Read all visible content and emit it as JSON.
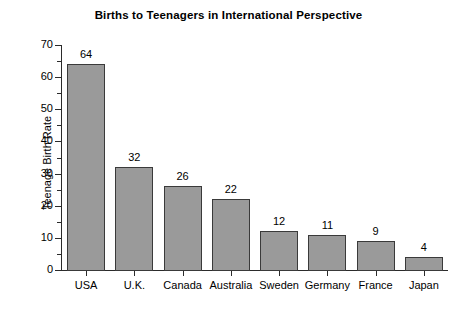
{
  "chart_data": {
    "type": "bar",
    "title": "Births to Teenagers in International Perspective",
    "xlabel": "",
    "ylabel": "Teenage Birth Rate",
    "categories": [
      "USA",
      "U.K.",
      "Canada",
      "Australia",
      "Sweden",
      "Germany",
      "France",
      "Japan"
    ],
    "values": [
      64,
      32,
      26,
      22,
      12,
      11,
      9,
      4
    ],
    "value_labels": [
      "64",
      "32",
      "26",
      "22",
      "12",
      "11",
      "9",
      "4"
    ],
    "ylim": [
      0,
      70
    ],
    "ytick_labels": [
      "0",
      "10",
      "20",
      "30",
      "40",
      "50",
      "60",
      "70"
    ],
    "ytick_values": [
      0,
      10,
      20,
      30,
      40,
      50,
      60,
      70
    ],
    "yminor_step": 5,
    "grid": false,
    "legend": false,
    "bar_color": "#9a9a9a",
    "bar_edge_color": "#3a3a3a",
    "axis_color": "#2b2b2b",
    "background": "#ffffff"
  }
}
